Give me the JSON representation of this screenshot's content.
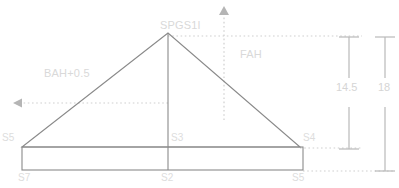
{
  "diagram": {
    "colors": {
      "outline": "#8a8a8a",
      "dotted": "#cfcfcf",
      "dimension": "#b9b9b9",
      "label_faint": "#d9d9d9",
      "background": "#ffffff"
    },
    "labels": {
      "apex": "SPGS1l",
      "front_height": "FAH",
      "back_height": "BAH+0.5"
    },
    "dimensions": [
      {
        "value": "14.5"
      },
      {
        "value": "18"
      }
    ],
    "nodes": {
      "left_eave": "S5",
      "center_eave": "S3",
      "right_eave": "S4",
      "left_base": "S7",
      "center_base": "S2",
      "right_base": "S5"
    }
  }
}
